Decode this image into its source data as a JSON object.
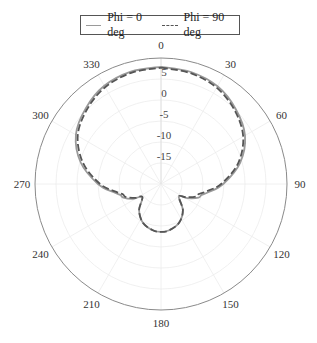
{
  "legend": {
    "items": [
      {
        "label": "Phi = 0 deg",
        "style": "solid",
        "color": "#9a9a9a"
      },
      {
        "label": "Phi = 90 deg",
        "style": "dashed",
        "color": "#555555"
      }
    ]
  },
  "chart_data": {
    "type": "polar-line",
    "title": "",
    "angle_ticks": [
      "0",
      "30",
      "60",
      "90",
      "120",
      "150",
      "180",
      "210",
      "240",
      "270",
      "300",
      "330"
    ],
    "radial_ticks": [
      "5",
      "0",
      "-5",
      "-10",
      "-15"
    ],
    "radial_range_db": [
      -20,
      10
    ],
    "grid": true,
    "legend_position": "top",
    "series": [
      {
        "name": "Phi = 0 deg",
        "theta_deg": [
          0,
          15,
          30,
          45,
          60,
          75,
          90,
          100,
          105,
          110,
          118,
          125,
          140,
          155,
          170,
          180,
          190,
          205,
          220,
          235,
          242,
          250,
          255,
          260,
          270,
          285,
          300,
          315,
          330,
          345,
          360
        ],
        "gain_db": [
          7.9,
          7.6,
          6.9,
          5.2,
          3.1,
          -0.5,
          -5.2,
          -8.6,
          -10.0,
          -10.5,
          -12.8,
          -14.8,
          -11.9,
          -9.8,
          -8.8,
          -8.6,
          -8.8,
          -9.8,
          -11.9,
          -14.6,
          -12.5,
          -10.5,
          -10.0,
          -8.6,
          -5.0,
          -0.2,
          3.4,
          5.4,
          7.0,
          7.7,
          7.9
        ]
      },
      {
        "name": "Phi = 90 deg",
        "theta_deg": [
          0,
          15,
          30,
          45,
          60,
          75,
          90,
          100,
          105,
          110,
          118,
          125,
          140,
          155,
          170,
          180,
          190,
          205,
          220,
          235,
          242,
          250,
          255,
          260,
          270,
          285,
          300,
          315,
          330,
          345,
          360
        ],
        "gain_db": [
          7.7,
          7.3,
          6.5,
          4.8,
          2.6,
          -1.0,
          -5.7,
          -9.3,
          -10.7,
          -11.2,
          -13.3,
          -14.8,
          -11.9,
          -9.8,
          -8.8,
          -8.6,
          -8.8,
          -9.8,
          -11.9,
          -14.6,
          -13.0,
          -11.0,
          -10.6,
          -9.2,
          -5.5,
          -0.8,
          2.9,
          5.0,
          6.6,
          7.4,
          7.7
        ]
      }
    ]
  }
}
